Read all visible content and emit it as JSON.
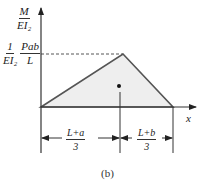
{
  "diagram": {
    "y_axis_label": {
      "num": "M",
      "den": "EI₂"
    },
    "peak_label": {
      "coef_num": "1",
      "coef_den": "EI₂",
      "num": "Pab",
      "den": "L"
    },
    "x_axis_label": "x",
    "dim_left": {
      "num": "L+a",
      "den": "3"
    },
    "dim_right": {
      "num": "L+b",
      "den": "3"
    },
    "caption": "(b)",
    "colors": {
      "fill": "#eeeeee",
      "stroke": "#555555",
      "axis": "#333333"
    }
  }
}
